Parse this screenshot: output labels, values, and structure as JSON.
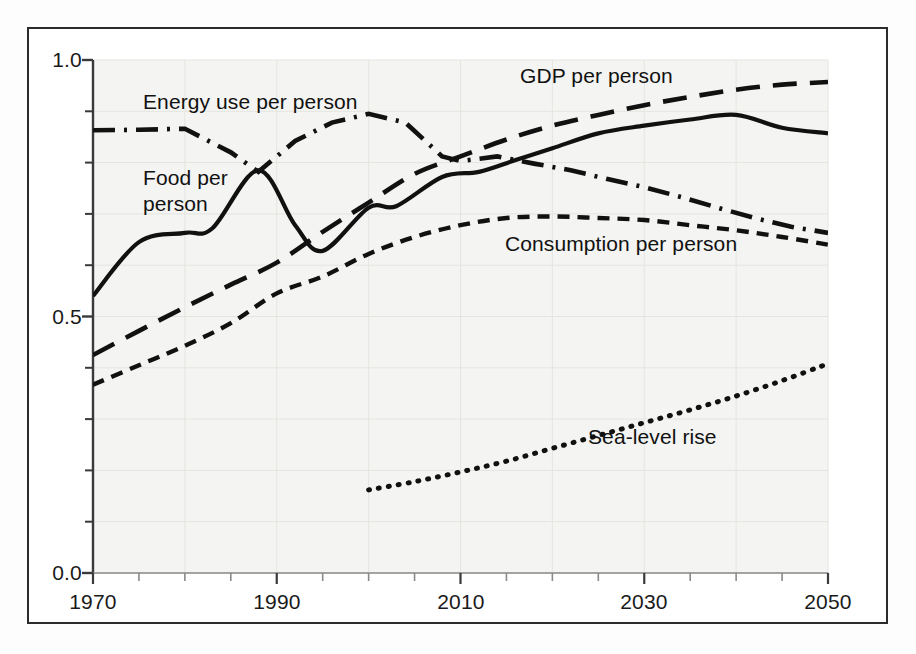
{
  "figure": {
    "border_color": "#2b2b2b",
    "background": "#ffffff",
    "plot_shading": "#f4f4f2",
    "line_color": "#111111"
  },
  "axis": {
    "y_labels": [
      "1.0",
      "0.5",
      "0.0"
    ],
    "y_label_values": [
      1.0,
      0.5,
      0.0
    ],
    "x_labels": [
      "1970",
      "1990",
      "2010",
      "2030",
      "2050"
    ],
    "x_label_values": [
      1970,
      1990,
      2010,
      2030,
      2050
    ]
  },
  "labels": {
    "energy": "Energy use per person",
    "food_line1": "Food per",
    "food_line2": "person",
    "gdp": "GDP per person",
    "consumption": "Consumption per person",
    "sea_level": "Sea-level rise"
  },
  "chart_data": {
    "type": "line",
    "title": "",
    "xlabel": "",
    "ylabel": "",
    "xlim": [
      1970,
      2050
    ],
    "ylim": [
      0.0,
      1.0
    ],
    "grid": true,
    "legend_position": "inline-annotations",
    "x_ticks_major": [
      1970,
      1990,
      2010,
      2030,
      2050
    ],
    "x_ticks_minor_step": 5,
    "y_ticks_major": [
      0.0,
      0.5,
      1.0
    ],
    "y_ticks_minor_step": 0.1,
    "series": [
      {
        "name": "Food per person",
        "style": "solid",
        "x": [
          1970,
          1975,
          1980,
          1983,
          1988,
          1992,
          1995,
          2000,
          2003,
          2008,
          2012,
          2016,
          2020,
          2025,
          2030,
          2035,
          2040,
          2045,
          2050
        ],
        "values": [
          0.54,
          0.645,
          0.663,
          0.672,
          0.785,
          0.678,
          0.628,
          0.712,
          0.715,
          0.772,
          0.782,
          0.805,
          0.828,
          0.857,
          0.872,
          0.884,
          0.893,
          0.868,
          0.857
        ]
      },
      {
        "name": "Energy use per person",
        "style": "dash-dot",
        "x": [
          1970,
          1975,
          1980,
          1985,
          1988,
          1992,
          1996,
          2000,
          2004,
          2008,
          2010,
          2014,
          2018,
          2022,
          2026,
          2030,
          2034,
          2038,
          2042,
          2046,
          2050
        ],
        "values": [
          0.863,
          0.864,
          0.866,
          0.82,
          0.782,
          0.842,
          0.878,
          0.895,
          0.878,
          0.812,
          0.803,
          0.812,
          0.798,
          0.785,
          0.768,
          0.752,
          0.733,
          0.712,
          0.692,
          0.675,
          0.663
        ]
      },
      {
        "name": "GDP per person",
        "style": "long-dash",
        "x": [
          1970,
          1975,
          1980,
          1985,
          1990,
          1995,
          2000,
          2005,
          2010,
          2015,
          2020,
          2025,
          2030,
          2035,
          2040,
          2045,
          2050
        ],
        "values": [
          0.425,
          0.472,
          0.518,
          0.562,
          0.605,
          0.665,
          0.722,
          0.778,
          0.812,
          0.845,
          0.872,
          0.893,
          0.912,
          0.928,
          0.942,
          0.952,
          0.957
        ]
      },
      {
        "name": "Consumption per person",
        "style": "short-dash",
        "x": [
          1970,
          1975,
          1980,
          1985,
          1990,
          1995,
          2000,
          2005,
          2010,
          2015,
          2020,
          2025,
          2030,
          2035,
          2040,
          2045,
          2050
        ],
        "values": [
          0.367,
          0.405,
          0.443,
          0.487,
          0.545,
          0.578,
          0.622,
          0.655,
          0.678,
          0.692,
          0.695,
          0.692,
          0.688,
          0.678,
          0.668,
          0.655,
          0.64
        ]
      },
      {
        "name": "Sea-level rise",
        "style": "dotted",
        "x": [
          2000,
          2005,
          2010,
          2015,
          2020,
          2025,
          2030,
          2035,
          2040,
          2045,
          2050
        ],
        "values": [
          0.162,
          0.178,
          0.197,
          0.218,
          0.243,
          0.268,
          0.293,
          0.318,
          0.345,
          0.375,
          0.408
        ]
      }
    ]
  }
}
